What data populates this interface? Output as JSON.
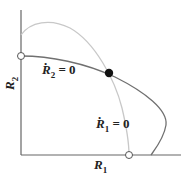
{
  "diagram": {
    "axes": {
      "x_label": {
        "base": "R",
        "sub": "1"
      },
      "y_label": {
        "base": "R",
        "sub": "2"
      }
    },
    "curves": [
      {
        "name": "R1-nullcline",
        "label_base": "R",
        "label_sub": "1",
        "label_rhs": " = 0",
        "color": "#c8c8c8"
      },
      {
        "name": "R2-nullcline",
        "label_base": "R",
        "label_sub": "2",
        "label_rhs": " = 0",
        "color": "#6e6e6e"
      }
    ],
    "points": [
      {
        "name": "equilibrium-interior",
        "type": "filled"
      },
      {
        "name": "equilibrium-R2-axis",
        "type": "open"
      },
      {
        "name": "equilibrium-R1-axis",
        "type": "open"
      }
    ]
  }
}
